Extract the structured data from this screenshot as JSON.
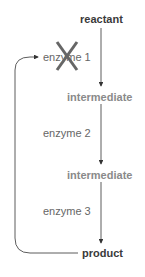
{
  "diagram": {
    "nodes": {
      "reactant": "reactant",
      "intermediate_1": "intermediate",
      "intermediate_2": "intermediate",
      "product": "product"
    },
    "enzymes": {
      "enzyme_1": "enzyme 1",
      "enzyme_2": "enzyme 2",
      "enzyme_3": "enzyme 3"
    },
    "inhibition_mark": "X",
    "colors": {
      "line": "#333333",
      "inhibition_x": "#666666",
      "node_dark": "#3a3a3a",
      "node_mid": "#8a8a8a"
    }
  }
}
